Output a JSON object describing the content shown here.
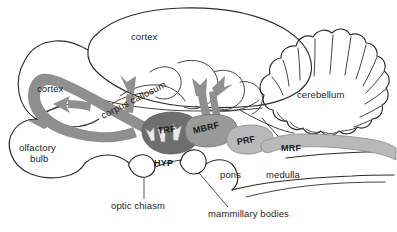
{
  "figure": {
    "colors": {
      "outline": "#2b2b2b",
      "band_mid": "#9a9a9a",
      "band_light": "#b9b9b9",
      "band_dark": "#6e6e6e",
      "corpus_callosum_band": "#8f8f8f",
      "background": "#ffffff"
    }
  },
  "labels": {
    "cortex_top": "cortex",
    "cortex_left": "cortex",
    "corpus_callosum": "corpus callosum",
    "cerebellum": "cerebellum",
    "olfactory_bulb_line1": "olfactory",
    "olfactory_bulb_line2": "bulb",
    "trf": "TRF",
    "mbrf": "MBRF",
    "prf": "PRF",
    "mrf": "MRF",
    "hyp": "HYP",
    "pons": "pons",
    "medulla": "medulla",
    "optic_chiasm": "optic chiasm",
    "mammillary_bodies": "mammillary bodies"
  }
}
